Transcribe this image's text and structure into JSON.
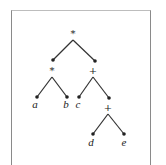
{
  "diagram": {
    "type": "expression-tree",
    "nodes": [
      {
        "id": "root",
        "label": "*",
        "kind": "operator"
      },
      {
        "id": "left-op",
        "label": "*",
        "kind": "operator"
      },
      {
        "id": "right-op",
        "label": "+",
        "kind": "operator"
      },
      {
        "id": "leaf-a",
        "label": "a",
        "kind": "operand"
      },
      {
        "id": "leaf-b",
        "label": "b",
        "kind": "operand"
      },
      {
        "id": "leaf-c",
        "label": "c",
        "kind": "operand"
      },
      {
        "id": "inner-op",
        "label": "+",
        "kind": "operator"
      },
      {
        "id": "leaf-d",
        "label": "d",
        "kind": "operand"
      },
      {
        "id": "leaf-e",
        "label": "e",
        "kind": "operand"
      }
    ],
    "edges": [
      [
        "root",
        "left-op"
      ],
      [
        "root",
        "right-op"
      ],
      [
        "left-op",
        "leaf-a"
      ],
      [
        "left-op",
        "leaf-b"
      ],
      [
        "right-op",
        "leaf-c"
      ],
      [
        "right-op",
        "inner-op"
      ],
      [
        "inner-op",
        "leaf-d"
      ],
      [
        "inner-op",
        "leaf-e"
      ]
    ],
    "colors": {
      "line": "#333333",
      "frame": "#8a8a8a",
      "background": "#ffffff"
    }
  }
}
